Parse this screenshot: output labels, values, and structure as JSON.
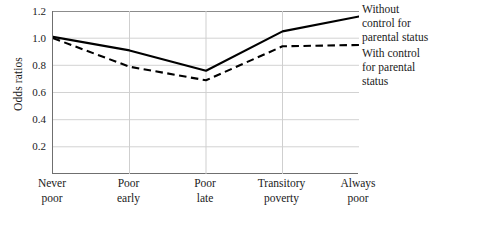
{
  "chart_data": {
    "type": "line",
    "title": "",
    "xlabel": "",
    "ylabel": "Odds ratios",
    "categories": [
      "Never poor",
      "Poor early",
      "Poor late",
      "Transitory poverty",
      "Always poor"
    ],
    "category_lines": [
      [
        "Never",
        "poor"
      ],
      [
        "Poor",
        "early"
      ],
      [
        "Poor",
        "late"
      ],
      [
        "Transitory",
        "poverty"
      ],
      [
        "Always",
        "poor"
      ]
    ],
    "ylim": [
      0.0,
      1.2
    ],
    "yticks": [
      1.2,
      1.0,
      0.8,
      0.6,
      0.4,
      0.2
    ],
    "ytick_labels": [
      "1.2",
      "1.0",
      "0.8",
      "0.6",
      "0.4",
      "0.2"
    ],
    "grid": "horizontal-and-vertical",
    "legend_position": "right",
    "series": [
      {
        "name": "Without control for parental status",
        "name_lines": [
          "Without",
          "control for",
          "parental status"
        ],
        "style": "solid",
        "color": "#000000",
        "values": [
          1.01,
          0.91,
          0.76,
          1.05,
          1.16
        ]
      },
      {
        "name": "With control for parental status",
        "name_lines": [
          "With control",
          "for parental",
          "status"
        ],
        "style": "dashed",
        "color": "#000000",
        "values": [
          1.0,
          0.79,
          0.69,
          0.94,
          0.95
        ]
      }
    ]
  },
  "axis": {
    "y_title": "Odds ratios",
    "y_tick_0": "1.2",
    "y_tick_1": "1.0",
    "y_tick_2": "0.8",
    "y_tick_3": "0.6",
    "y_tick_4": "0.4",
    "y_tick_5": "0.2"
  },
  "xaxis": {
    "t0_l1": "Never",
    "t0_l2": "poor",
    "t1_l1": "Poor",
    "t1_l2": "early",
    "t2_l1": "Poor",
    "t2_l2": "late",
    "t3_l1": "Transitory",
    "t3_l2": "poverty",
    "t4_l1": "Always",
    "t4_l2": "poor"
  },
  "legend": {
    "entry1_l1": "Without",
    "entry1_l2": "control for",
    "entry1_l3": "parental status",
    "entry2_l1": "With control",
    "entry2_l2": "for parental",
    "entry2_l3": "status"
  },
  "caption": {
    "text": ""
  }
}
